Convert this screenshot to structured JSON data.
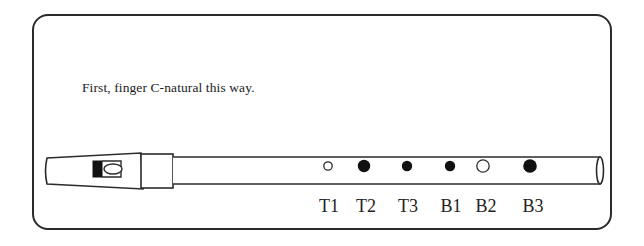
{
  "diagram": {
    "type": "tin-whistle-fingering-chart",
    "instruction": "First, finger C-natural this way.",
    "note": "C-natural",
    "colors": {
      "outline": "#2b2b2b",
      "closed_hole": "#111111",
      "open_hole": "#ffffff",
      "text": "#222222"
    },
    "holes": [
      {
        "label": "T1",
        "state": "open",
        "size": "small",
        "x": 328
      },
      {
        "label": "T2",
        "state": "closed",
        "size": "large",
        "x": 364
      },
      {
        "label": "T3",
        "state": "closed",
        "size": "small",
        "x": 407
      },
      {
        "label": "B1",
        "state": "closed",
        "size": "small",
        "x": 450
      },
      {
        "label": "B2",
        "state": "open",
        "size": "large",
        "x": 483
      },
      {
        "label": "B3",
        "state": "closed",
        "size": "large",
        "x": 530
      }
    ]
  }
}
